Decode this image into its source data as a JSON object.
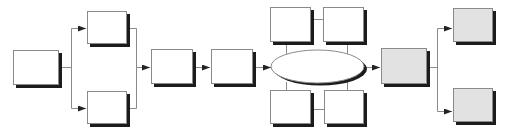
{
  "diagram": {
    "type": "flowchart",
    "colors": {
      "white_fill": "#ffffff",
      "gray_fill": "#e2e2e2",
      "border": "#8a8a8a",
      "shadow": "#1c1c1c",
      "connector": "#8a8a8a",
      "arrowhead": "#222222"
    },
    "nodes": [
      {
        "id": "start",
        "shape": "rect",
        "fill": "white",
        "x": 13,
        "y": 50,
        "w": 46,
        "h": 35,
        "label": ""
      },
      {
        "id": "branch-top",
        "shape": "rect",
        "fill": "white",
        "x": 87,
        "y": 11,
        "w": 40,
        "h": 33,
        "label": ""
      },
      {
        "id": "branch-bottom",
        "shape": "rect",
        "fill": "white",
        "x": 87,
        "y": 91,
        "w": 40,
        "h": 33,
        "label": ""
      },
      {
        "id": "step-3",
        "shape": "rect",
        "fill": "white",
        "x": 151,
        "y": 49,
        "w": 42,
        "h": 35,
        "label": ""
      },
      {
        "id": "step-4",
        "shape": "rect",
        "fill": "white",
        "x": 211,
        "y": 49,
        "w": 42,
        "h": 35,
        "label": ""
      },
      {
        "id": "hub",
        "shape": "ellipse",
        "fill": "white",
        "x": 271,
        "y": 50,
        "w": 93,
        "h": 33,
        "label": ""
      },
      {
        "id": "satellite-top-left",
        "shape": "rect",
        "fill": "white",
        "x": 270,
        "y": 7,
        "w": 41,
        "h": 35,
        "label": ""
      },
      {
        "id": "satellite-top-right",
        "shape": "rect",
        "fill": "white",
        "x": 323,
        "y": 7,
        "w": 41,
        "h": 35,
        "label": ""
      },
      {
        "id": "satellite-bottom-left",
        "shape": "rect",
        "fill": "white",
        "x": 270,
        "y": 90,
        "w": 41,
        "h": 34,
        "label": ""
      },
      {
        "id": "satellite-bottom-right",
        "shape": "rect",
        "fill": "white",
        "x": 324,
        "y": 90,
        "w": 40,
        "h": 34,
        "label": ""
      },
      {
        "id": "output",
        "shape": "rect",
        "fill": "gray",
        "x": 381,
        "y": 48,
        "w": 46,
        "h": 36,
        "label": ""
      },
      {
        "id": "output-top",
        "shape": "rect",
        "fill": "gray",
        "x": 453,
        "y": 8,
        "w": 40,
        "h": 34,
        "label": ""
      },
      {
        "id": "output-bottom",
        "shape": "rect",
        "fill": "gray",
        "x": 453,
        "y": 88,
        "w": 40,
        "h": 34,
        "label": ""
      }
    ],
    "edges": [
      {
        "from": "start",
        "to": "branch-top",
        "arrow": true
      },
      {
        "from": "start",
        "to": "branch-bottom",
        "arrow": true
      },
      {
        "from": "branch-top",
        "to": "step-3",
        "arrow": true
      },
      {
        "from": "branch-bottom",
        "to": "step-3",
        "arrow": true
      },
      {
        "from": "step-3",
        "to": "step-4",
        "arrow": true
      },
      {
        "from": "step-4",
        "to": "hub",
        "arrow": true
      },
      {
        "from": "hub",
        "to": "satellite-top-left",
        "arrow": false
      },
      {
        "from": "hub",
        "to": "satellite-top-right",
        "arrow": false
      },
      {
        "from": "hub",
        "to": "satellite-bottom-left",
        "arrow": false
      },
      {
        "from": "hub",
        "to": "satellite-bottom-right",
        "arrow": false
      },
      {
        "from": "satellite-top-left",
        "to": "satellite-top-right",
        "arrow": false
      },
      {
        "from": "satellite-bottom-left",
        "to": "satellite-bottom-right",
        "arrow": false
      },
      {
        "from": "hub",
        "to": "output",
        "arrow": true
      },
      {
        "from": "output",
        "to": "output-top",
        "arrow": true
      },
      {
        "from": "output",
        "to": "output-bottom",
        "arrow": true
      }
    ]
  }
}
